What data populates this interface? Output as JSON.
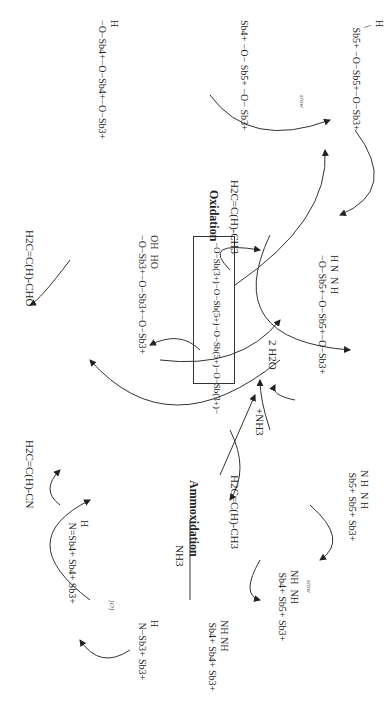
{
  "diagram": {
    "sections": {
      "oxidation_label": "Oxidation",
      "ammoxidation_label": "Ammoxidation"
    },
    "reactants": {
      "propylene_oxidation": "H2C=C(H)-CH3",
      "propylene_ammoxidation": "H2C=C(H)-CH3",
      "ammonia_feed": "NH3",
      "ammonia_add": "+NH3"
    },
    "products": {
      "acrolein": "H2C=C(H)-CHO",
      "acrylonitrile": "H2C=C(H)-CN",
      "water": "2 H2O"
    },
    "step_labels": {
      "slow_oxidation": "slow",
      "slow_ammoxidation": "slow",
      "oxidant": "[O]"
    },
    "central_site": {
      "label": "−O−Sb(3+)−O−Sb(5+)−O−Sb(5+)−O−Sb(3+)−",
      "boxed": true
    },
    "intermediates": [
      {
        "id": "ox-1",
        "desc": "allyl π-complex on Sb5+ site",
        "text": "H\n  \\\n   Sb5+ −O−Sb5+−O−Sb3+"
      },
      {
        "id": "ox-2",
        "desc": "allyl on Sb4+ (slow H-abstraction)",
        "text": "Sb4+ −O− Sb5+ −O− Sb3+"
      },
      {
        "id": "ox-3",
        "desc": "σ-O-allyl on Sb4+",
        "text": "H\n−O−Sb4+−O−Sb4+−O−Sb3+"
      },
      {
        "id": "reduced",
        "desc": "reduced site with OH groups",
        "text": "OH  HO\n−O−Sb3+−O−Sb3+−O−Sb3+"
      },
      {
        "id": "am-1",
        "desc": "imido site after NH3 activation",
        "text": "H N  N H\n−O−Sb5+−O−Sb5+−O−Sb3+"
      },
      {
        "id": "am-2",
        "desc": "allyl on imido Sb5+ site",
        "text": "N H  N H\n Sb5+ Sb5+ Sb3+"
      },
      {
        "id": "am-3",
        "desc": "allyl on NH Sb4+ (slow)",
        "text": "NH  NH\n Sb4+ Sb5+ Sb3+"
      },
      {
        "id": "am-4",
        "desc": "N-allyl on Sb4+",
        "text": "NH NH\n Sb4+ Sb4+ Sb3+"
      },
      {
        "id": "am-5",
        "desc": "N-allyl amine on Sb3+",
        "text": "H\n N−Sb3+ Sb3+"
      },
      {
        "id": "am-6",
        "desc": "imine intermediate on Sb4+",
        "text": "H\n N=Sb4+ Sb4+ Sb3+"
      }
    ],
    "oxidation_states": [
      "3+",
      "4+",
      "5+"
    ]
  }
}
